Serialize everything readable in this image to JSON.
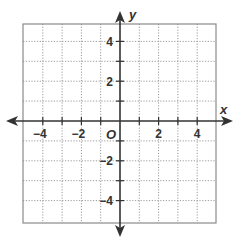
{
  "chart_data": {
    "type": "coordinate-grid",
    "title": "",
    "xlabel": "x",
    "ylabel": "y",
    "origin_label": "O",
    "xlim": [
      -5,
      5
    ],
    "ylim": [
      -5,
      5
    ],
    "grid": true,
    "grid_style": "dotted",
    "grid_step": 1,
    "x_tick_labels": [
      {
        "value": -4,
        "label": "−4"
      },
      {
        "value": -2,
        "label": "−2"
      },
      {
        "value": 2,
        "label": "2"
      },
      {
        "value": 4,
        "label": "4"
      }
    ],
    "y_tick_labels": [
      {
        "value": 4,
        "label": "4"
      },
      {
        "value": 2,
        "label": "2"
      },
      {
        "value": -2,
        "label": "−2"
      },
      {
        "value": -4,
        "label": "−4"
      }
    ],
    "points": [],
    "series": []
  },
  "colors": {
    "grid_line": "#9a9a9a",
    "border": "#8a8a8a",
    "axis": "#333333",
    "text": "#333333"
  }
}
